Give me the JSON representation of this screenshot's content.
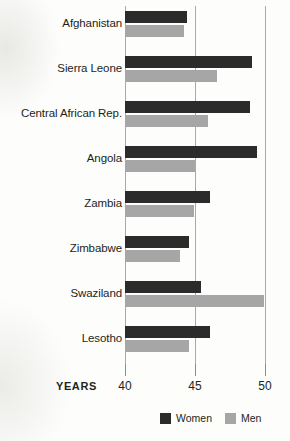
{
  "chart_data": {
    "type": "bar",
    "orientation": "horizontal",
    "title": "",
    "xlabel": "YEARS",
    "ylabel": "",
    "xlim": [
      40,
      50
    ],
    "xticks": [
      40,
      45,
      50
    ],
    "xtick_labels": [
      "40",
      "45",
      "50"
    ],
    "grid": true,
    "legend_position": "bottom-right",
    "categories": [
      "Afghanistan",
      "Sierra Leone",
      "Central African Rep.",
      "Angola",
      "Zambia",
      "Zimbabwe",
      "Swaziland",
      "Lesotho"
    ],
    "series": [
      {
        "name": "Women",
        "color": "#2b2b2b",
        "values": [
          44.4,
          49.1,
          48.9,
          49.4,
          46.1,
          44.6,
          45.4,
          46.1
        ]
      },
      {
        "name": "Men",
        "color": "#a6a6a6",
        "values": [
          44.2,
          46.6,
          45.9,
          45.0,
          44.9,
          43.9,
          49.9,
          44.6
        ]
      }
    ]
  },
  "axis": {
    "title": "YEARS"
  },
  "legend": {
    "items": [
      {
        "label": "Women",
        "color": "#2b2b2b"
      },
      {
        "label": "Men",
        "color": "#a6a6a6"
      }
    ]
  }
}
